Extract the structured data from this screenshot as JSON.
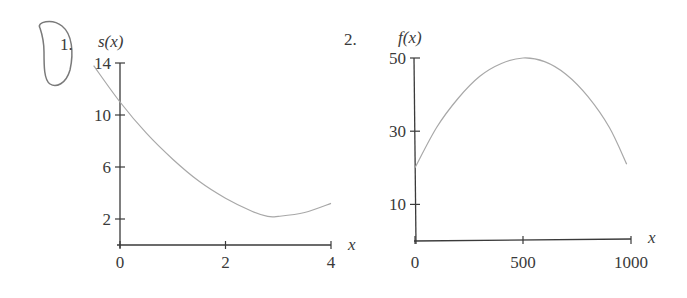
{
  "chart_data": [
    {
      "type": "line",
      "problem_number": "1.",
      "title": "",
      "ylabel": "s(x)",
      "xlabel": "x",
      "x_ticks": [
        "0",
        "2",
        "4"
      ],
      "y_ticks": [
        "2",
        "6",
        "10",
        "14"
      ],
      "xlim": [
        0,
        4
      ],
      "ylim": [
        0,
        14
      ],
      "grid": false,
      "series": [
        {
          "name": "s(x)",
          "x": [
            -0.5,
            0,
            0.5,
            1,
            1.5,
            2,
            2.5,
            2.8,
            3,
            3.5,
            4
          ],
          "values": [
            13.8,
            11,
            8.6,
            6.6,
            4.9,
            3.6,
            2.6,
            2.2,
            2.2,
            2.5,
            3.2
          ]
        }
      ],
      "annotation": "hand-drawn circle around problem number"
    },
    {
      "type": "line",
      "problem_number": "2.",
      "title": "",
      "ylabel": "f(x)",
      "xlabel": "x",
      "x_ticks": [
        "0",
        "500",
        "1000"
      ],
      "y_ticks": [
        "10",
        "30",
        "50"
      ],
      "xlim": [
        0,
        1000
      ],
      "ylim": [
        0,
        50
      ],
      "grid": false,
      "series": [
        {
          "name": "f(x)",
          "x": [
            0,
            100,
            200,
            300,
            400,
            500,
            600,
            700,
            800,
            900,
            980
          ],
          "values": [
            20,
            31,
            39,
            45,
            48.5,
            50,
            49,
            45.5,
            39.5,
            31,
            21
          ]
        }
      ]
    }
  ],
  "labels": {
    "p1": "1.",
    "p2": "2.",
    "c1_y": "s(x)",
    "c1_x": "x",
    "c2_y": "f(x)",
    "c2_x": "x"
  },
  "colors": {
    "axis": "#3a3a3a",
    "curve": "#a8a8a8",
    "annotation": "#777777"
  }
}
